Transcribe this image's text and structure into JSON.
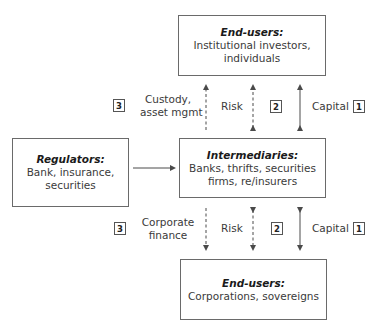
{
  "boxes": {
    "top_end_users": {
      "title": "End-users:",
      "line1": "Institutional investors,",
      "line2": "individuals"
    },
    "regulators": {
      "title": "Regulators:",
      "line1": "Bank, insurance,",
      "line2": "securities"
    },
    "intermediaries": {
      "title": "Intermediaries:",
      "line1": "Banks, thrifts, securities",
      "line2": "firms, re/insurers"
    },
    "bottom_end_users": {
      "title": "End-users:",
      "line1": "Corporations, sovereigns"
    }
  },
  "upper_flows": {
    "service": {
      "line1": "Custody,",
      "line2": "asset mgmt",
      "badge": "3"
    },
    "risk": {
      "label": "Risk",
      "badge": "2"
    },
    "capital": {
      "label": "Capital",
      "badge": "1"
    }
  },
  "lower_flows": {
    "service": {
      "line1": "Corporate",
      "line2": "finance",
      "badge": "3"
    },
    "risk": {
      "label": "Risk",
      "badge": "2"
    },
    "capital": {
      "label": "Capital",
      "badge": "1"
    }
  },
  "colors": {
    "line": "#5a5a5a",
    "border": "#6a6a6a",
    "text": "#3a3a3a"
  }
}
